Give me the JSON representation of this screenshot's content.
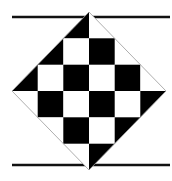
{
  "figure": {
    "colors": {
      "background": "#ffffff",
      "dark": "#000000",
      "light": "#ffffff",
      "outline": "#999999",
      "rule": "#111111"
    },
    "diamond": {
      "top": [
        89,
        12
      ],
      "right": [
        166,
        91
      ],
      "bottom": [
        89,
        170
      ],
      "left": [
        12,
        91
      ]
    },
    "grid": {
      "x": [
        12,
        37.7,
        63.3,
        89,
        114.7,
        140.3,
        166
      ],
      "y": [
        12,
        38.3,
        64.7,
        91,
        117.3,
        143.7,
        170
      ],
      "dark_rule": "(row+col) even"
    },
    "rules": [
      {
        "name": "top-rule",
        "y": 17,
        "x1": 12,
        "x2": 170
      },
      {
        "name": "bottom-rule",
        "y": 165,
        "x1": 12,
        "x2": 170
      }
    ]
  }
}
